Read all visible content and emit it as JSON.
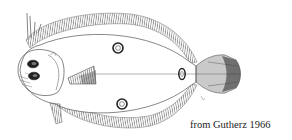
{
  "figure": {
    "caption": "from Gutherz 1966",
    "colors": {
      "background": "#ffffff",
      "ink": "#333333",
      "fin_shade": "#555555"
    },
    "features": [
      {
        "name": "head",
        "visible": true
      },
      {
        "name": "eyes",
        "count": 2
      },
      {
        "name": "dorsal-fin",
        "visible": true
      },
      {
        "name": "anal-fin",
        "visible": true
      },
      {
        "name": "pectoral-fin",
        "visible": true
      },
      {
        "name": "pelvic-fin",
        "visible": true
      },
      {
        "name": "caudal-fin",
        "visible": true
      },
      {
        "name": "ocellated-spots",
        "count": 3
      },
      {
        "name": "lateral-line",
        "visible": true
      }
    ]
  }
}
